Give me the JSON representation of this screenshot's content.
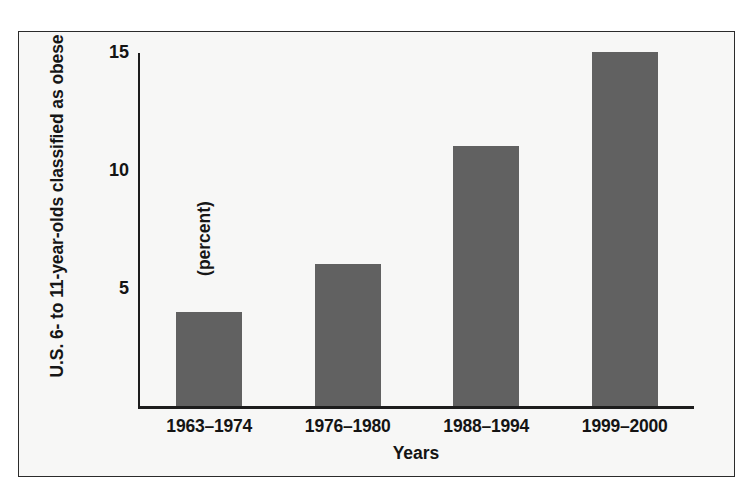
{
  "chart_data": {
    "type": "bar",
    "title": "",
    "subtitle": "",
    "categories": [
      "1963–1974",
      "1976–1980",
      "1988–1994",
      "1999–2000"
    ],
    "values": [
      4,
      6,
      11,
      15
    ],
    "xlabel": "Years",
    "ylabel": "U.S. 6- to 11-year-olds classified as obese",
    "ylabel_units": "(percent)",
    "ylim": [
      0,
      15
    ],
    "yticks": [
      5,
      10,
      15
    ],
    "ytick_labels": [
      "5",
      "10",
      "15"
    ],
    "grid": false,
    "legend": false,
    "legend_position": "none",
    "bar_color": "#616161",
    "axis_color": "#1d1d1d",
    "background_color": "#f7f7f6",
    "frame_border_color": "#2b2b2b"
  },
  "axis": {
    "y_title_line1": "U.S. 6- to 11-year-olds classified as obese",
    "y_title_line2": "(percent)",
    "x_title": "Years"
  }
}
